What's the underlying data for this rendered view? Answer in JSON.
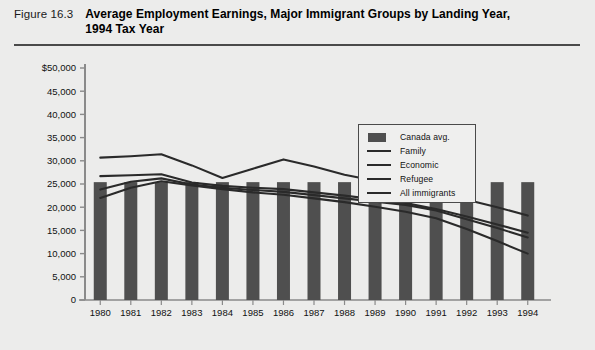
{
  "header": {
    "figure_label": "Figure 16.3",
    "title": "Average Employment Earnings, Major Immigrant Groups by Landing Year, 1994 Tax Year"
  },
  "legend": {
    "items": [
      {
        "label": "Canada avg.",
        "key": "bar-swatch",
        "color": "#4f4f4f"
      },
      {
        "label": "Family",
        "key": "line-swatch",
        "color": "#2a2a2a"
      },
      {
        "label": "Economic",
        "key": "line-swatch",
        "color": "#2a2a2a"
      },
      {
        "label": "Refugee",
        "key": "line-swatch",
        "color": "#2a2a2a"
      },
      {
        "label": "All immigrants",
        "key": "line-swatch",
        "color": "#2a2a2a"
      }
    ]
  },
  "chart_data": {
    "type": "line",
    "title": "Average Employment Earnings, Major Immigrant Groups by Landing Year, 1994 Tax Year",
    "xlabel": "",
    "ylabel": "",
    "grid": false,
    "legend_position": "top-right-inside",
    "categories": [
      "1980",
      "1981",
      "1982",
      "1983",
      "1984",
      "1985",
      "1986",
      "1987",
      "1988",
      "1989",
      "1990",
      "1991",
      "1992",
      "1993",
      "1994"
    ],
    "ylim": [
      0,
      50000
    ],
    "ytick_labels": [
      "$50,000",
      "45,000",
      "40,000",
      "35,000",
      "30,000",
      "25,000",
      "20,000",
      "15,000",
      "10,000",
      "5,000",
      "0"
    ],
    "ytick_values": [
      50000,
      45000,
      40000,
      35000,
      30000,
      25000,
      20000,
      15000,
      10000,
      5000,
      0
    ],
    "bar_series": {
      "name": "Canada avg.",
      "color": "#4f4f4f",
      "values": [
        25400,
        25400,
        25400,
        25400,
        25400,
        25400,
        25400,
        25400,
        25400,
        25400,
        25400,
        25400,
        25400,
        25400,
        25400
      ]
    },
    "series": [
      {
        "name": "Economic",
        "color": "#2a2a2a",
        "values": [
          30700,
          31000,
          31400,
          29000,
          26300,
          28300,
          30300,
          28800,
          27000,
          25700,
          24500,
          23100,
          21600,
          20000,
          18200
        ]
      },
      {
        "name": "All immigrants",
        "color": "#2a2a2a",
        "values": [
          26700,
          26900,
          27100,
          25300,
          24600,
          24200,
          23900,
          23200,
          22500,
          21700,
          20900,
          19600,
          18000,
          16300,
          14500
        ]
      },
      {
        "name": "Family",
        "color": "#2a2a2a",
        "values": [
          23800,
          25500,
          26200,
          24900,
          24200,
          23700,
          23300,
          22600,
          21900,
          21200,
          20500,
          19300,
          17400,
          15500,
          13500
        ]
      },
      {
        "name": "Refugee",
        "color": "#2a2a2a",
        "values": [
          22000,
          24200,
          25600,
          24700,
          23900,
          23200,
          22700,
          21900,
          21100,
          20100,
          19000,
          17600,
          15300,
          12700,
          10000
        ]
      }
    ]
  }
}
